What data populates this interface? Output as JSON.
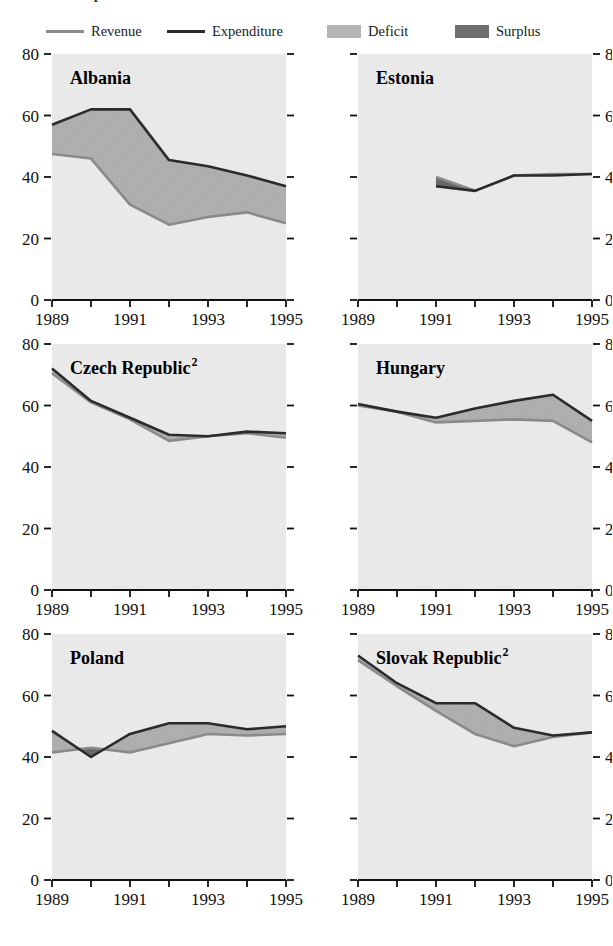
{
  "caption_cut": "Fiscal Developments",
  "legend": {
    "items": [
      {
        "id": "revenue",
        "label": "Revenue",
        "kind": "line",
        "color": "#8a8a8a",
        "width": 3
      },
      {
        "id": "expenditure",
        "label": "Expenditure",
        "kind": "line",
        "color": "#2b2b2b",
        "width": 3
      },
      {
        "id": "deficit",
        "label": "Deficit",
        "kind": "swatch",
        "color": "#b4b4b4"
      },
      {
        "id": "surplus",
        "label": "Surplus",
        "kind": "swatch",
        "color": "#6e6e6e"
      }
    ]
  },
  "axis": {
    "y_ticks": [
      0,
      20,
      40,
      60,
      80
    ],
    "y_min": 0,
    "y_max": 80,
    "x_ticks": [
      1989,
      1990,
      1991,
      1992,
      1993,
      1994,
      1995
    ],
    "x_tick_labels": [
      "1989",
      "",
      "1991",
      "",
      "1993",
      "",
      "1995"
    ],
    "x_min": 1989,
    "x_max": 1995,
    "plot_bg": "#e9e9e9",
    "grid": false
  },
  "chart_data": {
    "type": "area",
    "xlabel": "",
    "ylabel": "",
    "xlim": [
      1989,
      1995
    ],
    "ylim": [
      0,
      80
    ],
    "legend_position": "top",
    "panels": [
      {
        "name": "Albania",
        "superscript": "",
        "label_side": "left",
        "x": [
          1989,
          1990,
          1991,
          1992,
          1993,
          1994,
          1995
        ],
        "series": [
          {
            "name": "Revenue",
            "values": [
              47.5,
              46.0,
              31.0,
              24.5,
              27.0,
              28.5,
              25.0
            ]
          },
          {
            "name": "Expenditure",
            "values": [
              57.0,
              62.0,
              62.0,
              45.5,
              43.5,
              40.5,
              37.0
            ]
          }
        ]
      },
      {
        "name": "Estonia",
        "superscript": "",
        "label_side": "right",
        "x": [
          1991,
          1992,
          1993,
          1994,
          1995
        ],
        "series": [
          {
            "name": "Revenue",
            "values": [
              40.0,
              35.5,
              40.5,
              41.0,
              41.0
            ]
          },
          {
            "name": "Expenditure",
            "values": [
              37.0,
              35.5,
              40.5,
              40.5,
              41.0
            ]
          }
        ]
      },
      {
        "name": "Czech Republic",
        "superscript": "2",
        "label_side": "left",
        "x": [
          1989,
          1990,
          1991,
          1992,
          1993,
          1994,
          1995
        ],
        "series": [
          {
            "name": "Revenue",
            "values": [
              70.5,
              61.0,
              55.5,
              48.5,
              50.0,
              51.0,
              49.5
            ]
          },
          {
            "name": "Expenditure",
            "values": [
              72.0,
              61.5,
              56.0,
              50.5,
              50.0,
              51.5,
              51.0
            ]
          }
        ]
      },
      {
        "name": "Hungary",
        "superscript": "",
        "label_side": "right",
        "x": [
          1989,
          1990,
          1991,
          1992,
          1993,
          1994,
          1995
        ],
        "series": [
          {
            "name": "Revenue",
            "values": [
              60.0,
              58.0,
              54.5,
              55.0,
              55.5,
              55.0,
              48.0
            ]
          },
          {
            "name": "Expenditure",
            "values": [
              60.5,
              58.0,
              56.0,
              59.0,
              61.5,
              63.5,
              55.0
            ]
          }
        ]
      },
      {
        "name": "Poland",
        "superscript": "",
        "label_side": "left",
        "x": [
          1989,
          1990,
          1991,
          1992,
          1993,
          1994,
          1995
        ],
        "series": [
          {
            "name": "Revenue",
            "values": [
              41.5,
              43.0,
              41.5,
              44.5,
              47.5,
              47.0,
              47.5
            ]
          },
          {
            "name": "Expenditure",
            "values": [
              48.5,
              40.0,
              47.5,
              51.0,
              51.0,
              49.0,
              50.0
            ]
          }
        ]
      },
      {
        "name": "Slovak Republic",
        "superscript": "2",
        "label_side": "right",
        "x": [
          1989,
          1990,
          1991,
          1992,
          1993,
          1994,
          1995
        ],
        "series": [
          {
            "name": "Revenue",
            "values": [
              71.5,
              63.0,
              55.0,
              47.5,
              43.5,
              46.5,
              48.0
            ]
          },
          {
            "name": "Expenditure",
            "values": [
              73.0,
              64.0,
              57.5,
              57.5,
              49.5,
              47.0,
              48.0
            ]
          }
        ]
      }
    ]
  }
}
